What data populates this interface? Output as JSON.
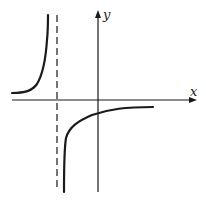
{
  "diagram": {
    "type": "function-graph",
    "axes": {
      "x_label": "x",
      "y_label": "y"
    },
    "asymptotes": {
      "vertical": "dashed line left of y-axis",
      "horizontal": "slightly below x-axis (curves approach)"
    },
    "colors": {
      "line": "#1a1a1a",
      "background": "#ffffff"
    }
  }
}
